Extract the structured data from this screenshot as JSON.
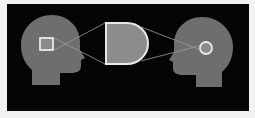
{
  "diagram": {
    "colors": {
      "background": "#050505",
      "border": "#f2f2f2",
      "head": "#6e6e6e",
      "shape_fill": "#8c8c8c",
      "shape_outline": "#e8e8e8",
      "line": "#9a9a9a"
    },
    "nodes": [
      {
        "id": "left-head",
        "shape": "head-silhouette",
        "facing": "right"
      },
      {
        "id": "left-concept",
        "shape": "square",
        "inside": "left-head"
      },
      {
        "id": "shared-concept",
        "shape": "D (half square, half circle)"
      },
      {
        "id": "right-head",
        "shape": "head-silhouette",
        "facing": "left"
      },
      {
        "id": "right-concept",
        "shape": "circle",
        "inside": "right-head"
      }
    ],
    "edges": [
      {
        "from": "left-concept",
        "to": "shared-concept",
        "style": "crossing lines"
      },
      {
        "from": "shared-concept",
        "to": "right-concept",
        "style": "converging lines"
      }
    ]
  }
}
